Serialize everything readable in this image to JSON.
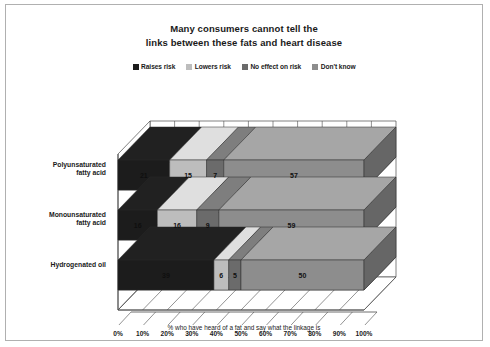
{
  "chart_data": {
    "type": "bar",
    "orientation": "horizontal",
    "stacked": true,
    "percent": true,
    "style": "3d-isometric",
    "title": "Many consumers cannot tell the links between these fats and heart disease",
    "title_lines": [
      "Many consumers cannot tell the",
      "links between these fats and heart disease"
    ],
    "xlabel": "% who have heard of a fat and say what the linkage is",
    "ylabel": "",
    "xlim": [
      0,
      100
    ],
    "xticks": [
      "0%",
      "10%",
      "20%",
      "30%",
      "40%",
      "50%",
      "60%",
      "70%",
      "80%",
      "90%",
      "100%"
    ],
    "xtick_values": [
      0,
      10,
      20,
      30,
      40,
      50,
      60,
      70,
      80,
      90,
      100
    ],
    "grid": true,
    "legend_position": "top",
    "categories": [
      "Polyunsaturated\nfatty acid",
      "Monounsaturated\nfatty acid",
      "Hydrogenated oil"
    ],
    "series": [
      {
        "name": "Raises risk",
        "color": "#1c1c1c",
        "values": [
          21,
          16,
          39
        ]
      },
      {
        "name": "Lowers risk",
        "color": "#bdbdbd",
        "values": [
          15,
          16,
          6
        ]
      },
      {
        "name": "No effect on risk",
        "color": "#6b6b6b",
        "values": [
          7,
          9,
          5
        ]
      },
      {
        "name": "Don't know",
        "color": "#8d8d8d",
        "values": [
          57,
          59,
          50
        ]
      }
    ]
  },
  "caption": "% who have heard of a fat and say what the linkage is",
  "colors": {
    "raises_risk": "#1c1c1c",
    "lowers_risk": "#bdbdbd",
    "no_effect": "#6b6b6b",
    "dont_know": "#8d8d8d",
    "frame_border": "#b0b0b0",
    "axis": "#4a4a4a",
    "background": "#ffffff"
  }
}
